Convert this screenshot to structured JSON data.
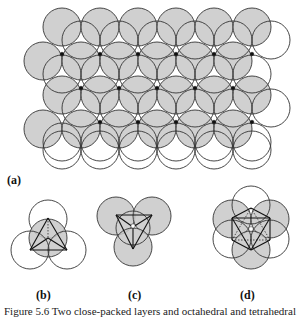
{
  "figure": {
    "panel_labels": {
      "a": "(a)",
      "b": "(b)",
      "c": "(c)",
      "d": "(d)"
    },
    "caption": "Figure 5.6  Two close-packed layers and octahedral and tetrahedral",
    "colors": {
      "shaded_fill": "#c8c8c8",
      "stroke": "#333333",
      "open_fill": "#ffffff",
      "site_dot": "#111111"
    },
    "panel_a": {
      "description": "Two superimposed close-packed layers of spheres: shaded lower layer and outlined upper layer; black dots mark octahedral sites, white gaps tetrahedral sites",
      "circle_radius": 19,
      "lower_layer_rows": 4,
      "upper_layer_rows": 4,
      "columns": 6
    },
    "panel_b": {
      "description": "Tetrahedral site: one shaded sphere with three outlined spheres, tetrahedron drawn"
    },
    "panel_c": {
      "description": "Tetrahedral site viewed from other side: three shaded spheres and one central"
    },
    "panel_d": {
      "description": "Octahedral site: three shaded and three outlined spheres, octahedron drawn"
    }
  }
}
